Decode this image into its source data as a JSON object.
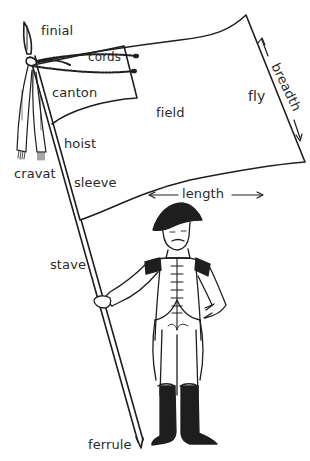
{
  "diagram": {
    "labels": {
      "finial": "finial",
      "cords": "cords",
      "canton": "canton",
      "cravat": "cravat",
      "hoist": "hoist",
      "sleeve": "sleeve",
      "field": "field",
      "fly": "fly",
      "breadth": "breadth",
      "length": "length",
      "stave": "stave",
      "ferrule": "ferrule"
    },
    "colors": {
      "ink": "#1e1e1e",
      "background": "#ffffff"
    }
  }
}
